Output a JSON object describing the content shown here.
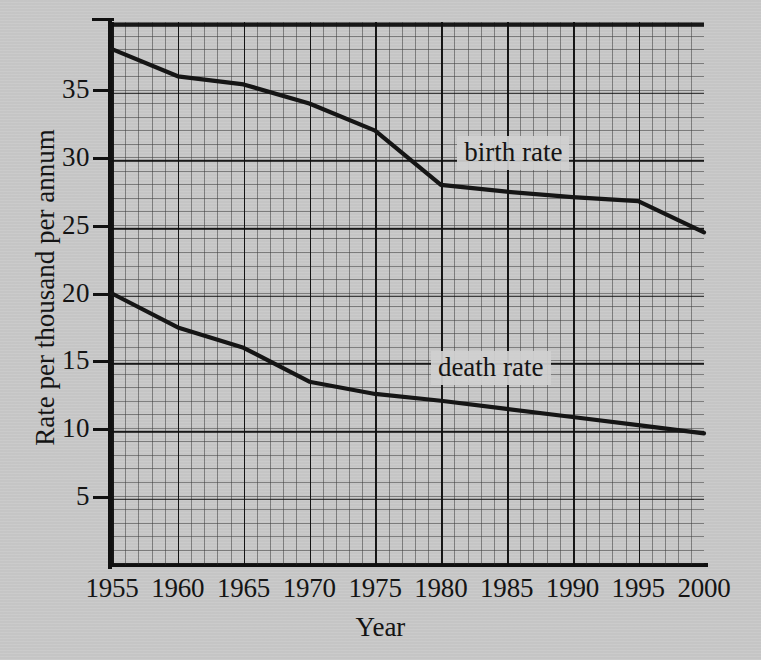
{
  "chart_data": {
    "type": "line",
    "title": "",
    "xlabel": "Year",
    "ylabel": "Rate per thousand per annum",
    "xlim": [
      1955,
      2000
    ],
    "ylim": [
      0,
      40
    ],
    "xticks": [
      "1955",
      "1960",
      "1965",
      "1970",
      "1975",
      "1980",
      "1985",
      "1990",
      "1995",
      "2000"
    ],
    "yticks": [
      "5",
      "10",
      "15",
      "20",
      "25",
      "30",
      "35"
    ],
    "grid": "major and minor grid, graph paper style",
    "legend": "inline annotations on curves",
    "x": [
      1955,
      1960,
      1965,
      1970,
      1975,
      1980,
      1985,
      1990,
      1995,
      2000
    ],
    "series": [
      {
        "name": "birth rate",
        "label": "birth rate",
        "color": "#151515",
        "values": [
          38.0,
          36.0,
          35.4,
          34.0,
          32.0,
          28.0,
          27.5,
          27.1,
          26.8,
          24.5
        ],
        "annotation_x": 1982,
        "annotation_y": 30.4
      },
      {
        "name": "death rate",
        "label": "death rate",
        "color": "#151515",
        "values": [
          20.0,
          17.5,
          16.0,
          13.5,
          12.6,
          12.1,
          11.5,
          10.9,
          10.3,
          9.7
        ],
        "annotation_x": 1980,
        "annotation_y": 14.6
      }
    ]
  },
  "axes": {
    "y_label_text": "Rate per thousand per annum",
    "x_label_text": "Year"
  }
}
